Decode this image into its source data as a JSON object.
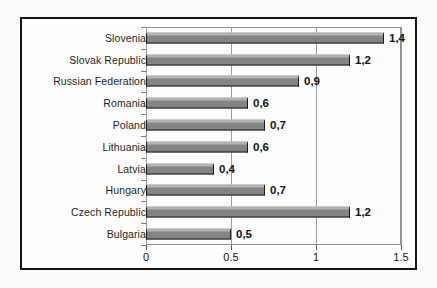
{
  "chart_data": {
    "type": "bar",
    "orientation": "horizontal",
    "title": "",
    "subtitle": "",
    "xlabel": "",
    "ylabel": "",
    "categories": [
      "Slovenia",
      "Slovak Republic",
      "Russian Federation",
      "Romania",
      "Poland",
      "Lithuania",
      "Latvia",
      "Hungary",
      "Czech Republic",
      "Bulgaria"
    ],
    "values": [
      1.4,
      1.2,
      0.9,
      0.6,
      0.7,
      0.6,
      0.4,
      0.7,
      1.2,
      0.5
    ],
    "data_labels": [
      "1,4",
      "1,2",
      "0,9",
      "0,6",
      "0,7",
      "0,6",
      "0,4",
      "0,7",
      "1,2",
      "0,5"
    ],
    "xlim": [
      0,
      1.5
    ],
    "xticks": [
      0,
      0.5,
      1,
      1.5
    ],
    "xtick_labels": [
      "0",
      "0.5",
      "1",
      "1.5"
    ],
    "grid": true,
    "grid_axis": "x",
    "legend": null,
    "bar_color": "#848484",
    "bar_edge_color": "#1a1a1a",
    "gridline_color": "#9a9a9a",
    "frame_color": "#151515",
    "background_color": "#fbfbfa",
    "annotations": []
  }
}
